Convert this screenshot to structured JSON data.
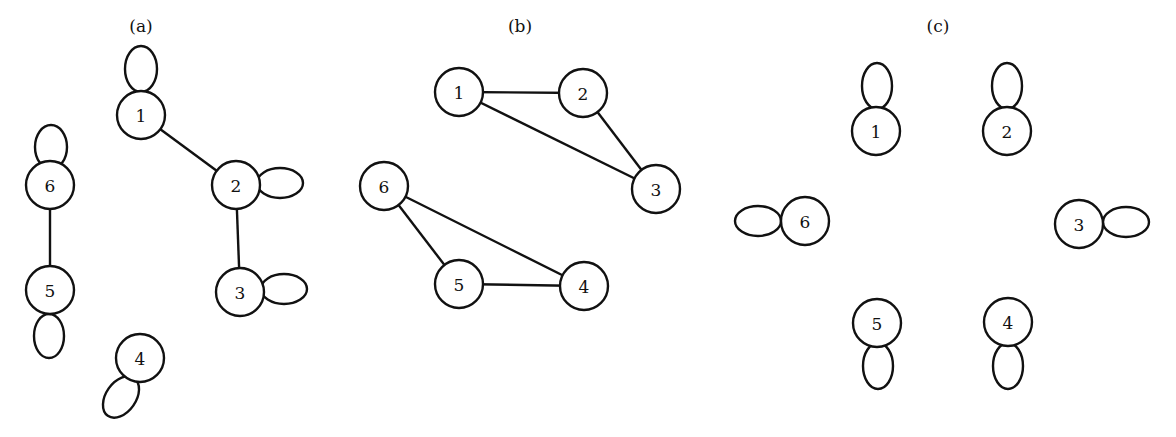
{
  "panels": [
    {
      "id": "a",
      "title": "(a)",
      "title_pos": [
        141,
        32
      ],
      "nodes": [
        {
          "label": "1",
          "x": 141,
          "y": 115
        },
        {
          "label": "2",
          "x": 236,
          "y": 185
        },
        {
          "label": "3",
          "x": 240,
          "y": 292
        },
        {
          "label": "4",
          "x": 140,
          "y": 358
        },
        {
          "label": "5",
          "x": 50,
          "y": 290
        },
        {
          "label": "6",
          "x": 50,
          "y": 185
        }
      ],
      "edges": [
        [
          "1",
          "2"
        ],
        [
          "2",
          "3"
        ],
        [
          "6",
          "5"
        ]
      ],
      "loops": [
        {
          "node": "1",
          "cx": 141,
          "cy": 69,
          "rx": 16,
          "ry": 23,
          "rot": 0
        },
        {
          "node": "2",
          "cx": 280,
          "cy": 183,
          "rx": 23,
          "ry": 15,
          "rot": 0
        },
        {
          "node": "3",
          "cx": 284,
          "cy": 289,
          "rx": 23,
          "ry": 15,
          "rot": 0
        },
        {
          "node": "4",
          "cx": 121,
          "cy": 397,
          "rx": 15,
          "ry": 23,
          "rot": 35
        },
        {
          "node": "5",
          "cx": 49,
          "cy": 336,
          "rx": 15,
          "ry": 22,
          "rot": 0
        },
        {
          "node": "6",
          "cx": 51,
          "cy": 147,
          "rx": 16,
          "ry": 22,
          "rot": 0
        }
      ]
    },
    {
      "id": "b",
      "title": "(b)",
      "title_pos": [
        520,
        32
      ],
      "nodes": [
        {
          "label": "1",
          "x": 459,
          "y": 92
        },
        {
          "label": "2",
          "x": 583,
          "y": 93
        },
        {
          "label": "3",
          "x": 656,
          "y": 189
        },
        {
          "label": "4",
          "x": 584,
          "y": 286
        },
        {
          "label": "5",
          "x": 459,
          "y": 284
        },
        {
          "label": "6",
          "x": 384,
          "y": 186
        }
      ],
      "edges": [
        [
          "1",
          "2"
        ],
        [
          "1",
          "3"
        ],
        [
          "2",
          "3"
        ],
        [
          "6",
          "5"
        ],
        [
          "6",
          "4"
        ],
        [
          "5",
          "4"
        ]
      ],
      "loops": []
    },
    {
      "id": "c",
      "title": "(c)",
      "title_pos": [
        938,
        32
      ],
      "nodes": [
        {
          "label": "1",
          "x": 876,
          "y": 131
        },
        {
          "label": "2",
          "x": 1007,
          "y": 131
        },
        {
          "label": "3",
          "x": 1079,
          "y": 224
        },
        {
          "label": "4",
          "x": 1008,
          "y": 322
        },
        {
          "label": "5",
          "x": 877,
          "y": 323
        },
        {
          "label": "6",
          "x": 805,
          "y": 221
        }
      ],
      "edges": [],
      "loops": [
        {
          "node": "1",
          "cx": 877,
          "cy": 86,
          "rx": 15,
          "ry": 23,
          "rot": 0
        },
        {
          "node": "2",
          "cx": 1007,
          "cy": 86,
          "rx": 15,
          "ry": 23,
          "rot": 0
        },
        {
          "node": "3",
          "cx": 1126,
          "cy": 222,
          "rx": 23,
          "ry": 15,
          "rot": 0
        },
        {
          "node": "4",
          "cx": 1008,
          "cy": 366,
          "rx": 15,
          "ry": 23,
          "rot": 0
        },
        {
          "node": "5",
          "cx": 878,
          "cy": 366,
          "rx": 15,
          "ry": 23,
          "rot": 0
        },
        {
          "node": "6",
          "cx": 758,
          "cy": 221,
          "rx": 23,
          "ry": 15,
          "rot": 0
        }
      ]
    }
  ],
  "node_radius": 24,
  "colors": {
    "stroke": "#111111",
    "background": "#ffffff"
  }
}
